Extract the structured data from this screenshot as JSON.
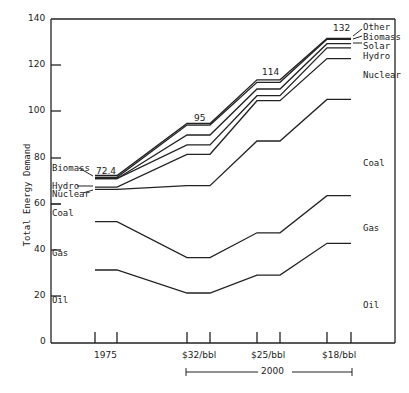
{
  "chart_data": {
    "type": "area",
    "title": "",
    "xlabel": "",
    "ylabel": "Total Energy Demand",
    "ylim": [
      0,
      140
    ],
    "yticks": [
      0,
      20,
      40,
      60,
      80,
      100,
      120,
      140
    ],
    "grid": false,
    "categories": [
      "1975",
      "$32/bbl",
      "$25/bbl",
      "$18/bbl"
    ],
    "category_group": "2000",
    "stacking": "stacked",
    "totals": [
      72.4,
      95,
      114,
      132
    ],
    "series": [
      {
        "name": "Oil",
        "values": [
          31.3,
          21.3,
          29.1,
          42.9
        ]
      },
      {
        "name": "Gas",
        "values": [
          21.0,
          15.4,
          18.4,
          20.7
        ]
      },
      {
        "name": "Coal",
        "values": [
          0.0,
          0.0,
          0.0,
          0.0
        ]
      },
      {
        "name": "Nuclear",
        "values": [
          0.0,
          0.0,
          0.0,
          0.0
        ]
      },
      {
        "name": "Hydro",
        "values": [
          0.9,
          4.1,
          2.0,
          4.7
        ]
      },
      {
        "name": "Solar",
        "values": [
          0.0,
          4.3,
          3.0,
          1.8
        ]
      },
      {
        "name": "Biomass",
        "values": [
          0.0,
          0.0,
          0.0,
          0.0
        ]
      },
      {
        "name": "Other",
        "values": [
          0.0,
          0.0,
          0.0,
          0.0
        ]
      }
    ],
    "cumulative_tops": {
      "Oil": [
        31.3,
        21.3,
        29.1,
        42.9
      ],
      "Gas": [
        52.3,
        36.7,
        47.5,
        63.6
      ],
      "Coal": [
        66.4,
        68.0,
        87.4,
        105.5
      ],
      "Nuclear": [
        67.3,
        81.6,
        104.9,
        123.2
      ],
      "Hydro": [
        71.0,
        85.7,
        107.1,
        127.9
      ],
      "Solar": [
        71.0,
        90.0,
        110.0,
        129.7
      ],
      "Biomass": [
        71.6,
        94.3,
        112.9,
        131.6
      ],
      "Other": [
        72.4,
        95.0,
        114.0,
        132.0
      ]
    },
    "annotations": [
      "72.4",
      "95",
      "114",
      "132"
    ],
    "legend_position": "inline labels at left and right edges"
  },
  "axis": {
    "y_label": "Total Energy Demand",
    "y_ticks": [
      "0",
      "20",
      "40",
      "60",
      "80",
      "100",
      "120",
      "140"
    ],
    "x_ticks": [
      "1975",
      "$32/bbl",
      "$25/bbl",
      "$18/bbl"
    ],
    "x_group": "2000"
  },
  "totals": [
    "72.4",
    "95",
    "114",
    "132"
  ],
  "left_labels": {
    "biomass": "Biomass",
    "hydro": "Hydro",
    "nuclear": "Nuclear",
    "coal": "Coal",
    "gas": "Gas",
    "oil": "Oil"
  },
  "right_labels": {
    "other": "Other",
    "biomass": "Biomass",
    "solar": "Solar",
    "hydro": "Hydro",
    "nuclear": "Nuclear",
    "coal": "Coal",
    "gas": "Gas",
    "oil": "Oil"
  },
  "style": {
    "line_color": "#222222",
    "axis_color": "#222222",
    "background": "#ffffff"
  }
}
